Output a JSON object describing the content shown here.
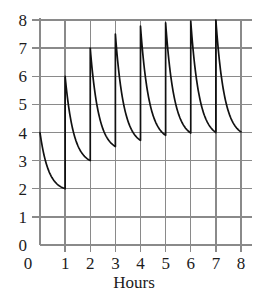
{
  "chart_data": {
    "type": "line",
    "title": "",
    "subtitle": "",
    "xlabel": "Hours",
    "ylabel": "",
    "xlim": [
      0,
      8
    ],
    "ylim": [
      0,
      8
    ],
    "xticks": [
      0,
      1,
      2,
      3,
      4,
      5,
      6,
      7,
      8
    ],
    "xtick_labels": [
      "0",
      "1",
      "2",
      "3",
      "4",
      "5",
      "6",
      "7",
      "8"
    ],
    "yticks": [
      0,
      1,
      2,
      3,
      4,
      5,
      6,
      7,
      8
    ],
    "ytick_labels": [
      "0",
      "1",
      "2",
      "3",
      "4",
      "5",
      "6",
      "7",
      "8"
    ],
    "grid": true,
    "grid_color": "#8a8a8a",
    "line_color": "#111111",
    "background_color": "#ffffff",
    "legend": [],
    "annotations": [],
    "series": [
      {
        "name": "concentration",
        "doses": [
          {
            "hour_start": 0,
            "hour_end": 1,
            "start_value": 4.0,
            "end_value": 2.0
          },
          {
            "hour_start": 1,
            "hour_end": 2,
            "start_value": 6.0,
            "end_value": 3.0
          },
          {
            "hour_start": 2,
            "hour_end": 3,
            "start_value": 7.0,
            "end_value": 3.5
          },
          {
            "hour_start": 3,
            "hour_end": 4,
            "start_value": 7.5,
            "end_value": 3.72
          },
          {
            "hour_start": 4,
            "hour_end": 5,
            "start_value": 7.78,
            "end_value": 3.9
          },
          {
            "hour_start": 5,
            "hour_end": 6,
            "start_value": 7.9,
            "end_value": 3.98
          },
          {
            "hour_start": 6,
            "hour_end": 7,
            "start_value": 7.96,
            "end_value": 4.0
          },
          {
            "hour_start": 7,
            "hour_end": 8,
            "start_value": 8.0,
            "end_value": 4.02
          }
        ],
        "peaks": [
          4.0,
          6.0,
          7.0,
          7.5,
          7.78,
          7.9,
          7.96,
          8.0
        ],
        "troughs": [
          2.0,
          3.0,
          3.5,
          3.72,
          3.9,
          3.98,
          4.0,
          4.02
        ],
        "x": [
          0,
          1,
          1,
          2,
          2,
          3,
          3,
          4,
          4,
          5,
          5,
          6,
          6,
          7,
          7,
          8
        ],
        "y": [
          4.0,
          2.0,
          6.0,
          3.0,
          7.0,
          3.5,
          7.5,
          3.72,
          7.78,
          3.9,
          7.9,
          3.98,
          7.96,
          4.0,
          8.0,
          4.02
        ]
      }
    ]
  }
}
